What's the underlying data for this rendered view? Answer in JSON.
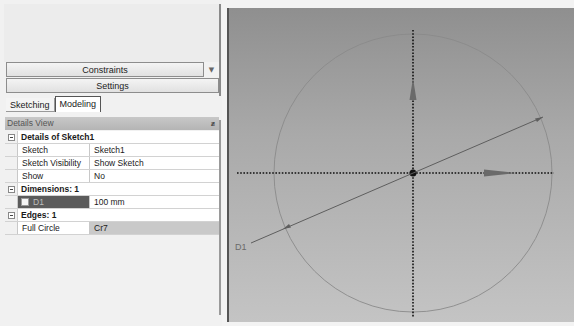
{
  "left_panel": {
    "constraints_label": "Constraints",
    "constraints_dropdown_icon": "chevron-down-icon",
    "settings_label": "Settings",
    "tabs": [
      {
        "label": "Sketching",
        "active": false
      },
      {
        "label": "Modeling",
        "active": true
      }
    ]
  },
  "details_view": {
    "title": "Details View",
    "pin_icon": "pin-icon",
    "groups": [
      {
        "label": "Details of Sketch1",
        "rows": [
          {
            "name": "Sketch",
            "value": "Sketch1"
          },
          {
            "name": "Sketch Visibility",
            "value": "Show Sketch"
          },
          {
            "name": "Show Constraints?",
            "value": "No"
          }
        ]
      },
      {
        "label": "Dimensions: 1",
        "rows": [
          {
            "name": "D1",
            "value": "100 mm",
            "checkbox": true
          }
        ]
      },
      {
        "label": "Edges: 1",
        "rows": [
          {
            "name": "Full Circle",
            "value": "Cr7"
          }
        ]
      }
    ]
  },
  "viewport": {
    "dimension_label": "D1",
    "colors": {
      "circle": "#8a8a8a",
      "axis": "#111111",
      "dimension_line": "#5e5e5e",
      "arrow": "#6a6a6a"
    }
  }
}
